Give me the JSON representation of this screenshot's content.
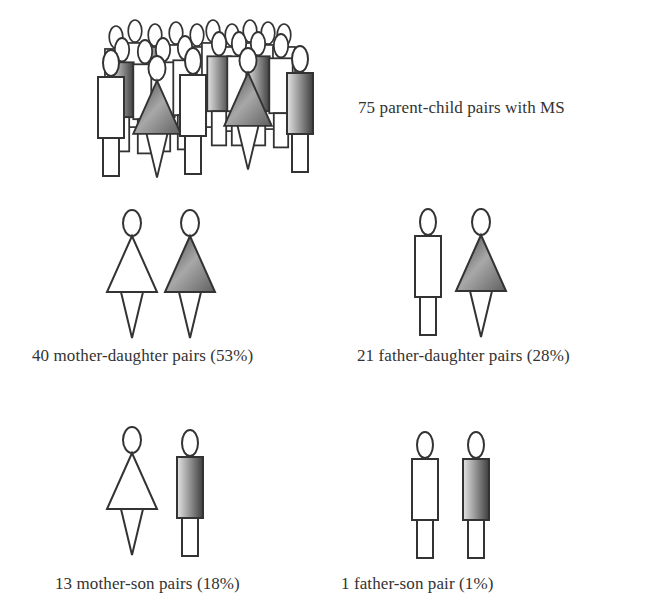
{
  "diagram": {
    "title_label": "75 parent-child pairs with MS",
    "colors": {
      "stroke": "#333333",
      "fill_dark": "#4a4a4a",
      "fill_light": "#d0d0d0",
      "background": "#ffffff"
    },
    "groups": [
      {
        "id": "mother-daughter",
        "label": "40 mother-daughter pairs (53%)",
        "count": 40,
        "percent": 53,
        "parent": "mother",
        "child": "daughter"
      },
      {
        "id": "father-daughter",
        "label": "21 father-daughter pairs (28%)",
        "count": 21,
        "percent": 28,
        "parent": "father",
        "child": "daughter"
      },
      {
        "id": "mother-son",
        "label": "13 mother-son pairs (18%)",
        "count": 13,
        "percent": 18,
        "parent": "mother",
        "child": "son"
      },
      {
        "id": "father-son",
        "label": "1 father-son pair (1%)",
        "count": 1,
        "percent": 1,
        "parent": "father",
        "child": "son"
      }
    ],
    "legend_note": {
      "unshaded": "parent",
      "shaded": "child with MS"
    }
  }
}
